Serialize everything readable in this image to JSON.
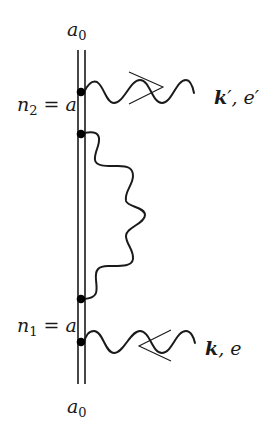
{
  "diagram": {
    "type": "feynman-diagram",
    "labels": {
      "top_state": {
        "base": "a",
        "sub": "0"
      },
      "bottom_state": {
        "base": "a",
        "sub": "0"
      },
      "upper_vertex": {
        "base": "n",
        "sub": "2",
        "rest": " = a"
      },
      "lower_vertex": {
        "base": "n",
        "sub": "1",
        "rest": " = a"
      },
      "outgoing_photon": {
        "vector": "k",
        "prime": "′",
        "sep": ", ",
        "pol": "e",
        "pol_prime": "′"
      },
      "incoming_photon": {
        "vector": "k",
        "sep": ", ",
        "pol": "e"
      }
    },
    "nodes": [
      {
        "id": "vertex-outgoing-photon",
        "x": 81,
        "y": 92
      },
      {
        "id": "vertex-loop-top",
        "x": 81,
        "y": 134
      },
      {
        "id": "vertex-loop-bottom",
        "x": 81,
        "y": 299
      },
      {
        "id": "vertex-incoming-photon",
        "x": 81,
        "y": 342
      }
    ],
    "edges": [
      {
        "id": "electron-propagator",
        "type": "double-line",
        "from": "top",
        "to": "bottom"
      },
      {
        "id": "outgoing-photon",
        "type": "wavy",
        "from": "vertex-outgoing-photon",
        "arrow": "right",
        "label": "k′, e′"
      },
      {
        "id": "internal-photon-loop",
        "type": "wavy",
        "from": "vertex-loop-top",
        "to": "vertex-loop-bottom"
      },
      {
        "id": "incoming-photon",
        "type": "wavy",
        "to": "vertex-incoming-photon",
        "arrow": "left",
        "label": "k, e"
      }
    ],
    "colors": {
      "ink": "#1a1a1a",
      "background": "#ffffff"
    }
  }
}
